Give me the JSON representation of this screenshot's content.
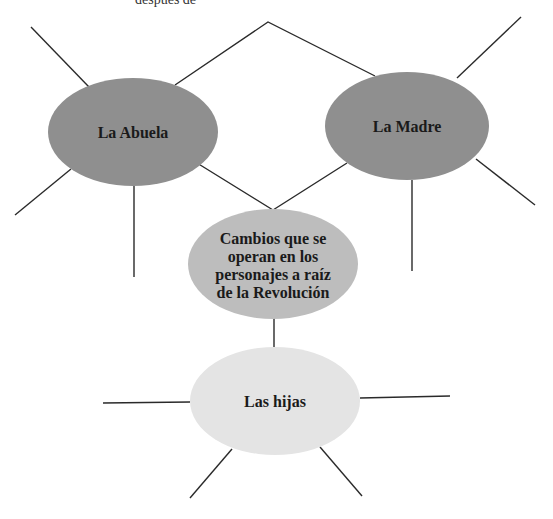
{
  "header_fragment": "después de",
  "colors": {
    "dark_node": "#8f8f8f",
    "center_node": "#bdbdbd",
    "light_node": "#e4e4e4",
    "line": "#2a2a2a",
    "text": "#1a1a1a"
  },
  "nodes": {
    "abuela": {
      "label": "La Abuela"
    },
    "madre": {
      "label": "La Madre"
    },
    "center": {
      "lines": [
        "Cambios que se",
        "operan en los",
        "personajes a raíz",
        "de la Revolución"
      ]
    },
    "hijas": {
      "label": "Las hijas"
    }
  }
}
